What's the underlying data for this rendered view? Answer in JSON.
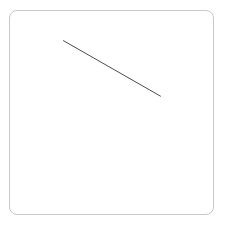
{
  "app": {
    "title": "Drawing Canvas",
    "background_color": "#ffffff"
  },
  "canvas_panel": {
    "name": "drawing-canvas",
    "fill_color": "#ffffff",
    "border_color": "#c9c9c9",
    "border_width_px": 1,
    "corner_radius_px": 8,
    "x": 9,
    "y": 10,
    "width": 205,
    "height": 205
  },
  "drawing": {
    "surface_width": 205,
    "surface_height": 205,
    "shape_count": 1,
    "shapes": [
      {
        "id": "stroke-1",
        "type": "line",
        "name": "diagonal-line",
        "x1": 54,
        "y1": 30,
        "x2": 152,
        "y2": 86,
        "stroke_color": "#4a4a4a",
        "stroke_width_px": 1,
        "linecap": "round"
      }
    ]
  }
}
